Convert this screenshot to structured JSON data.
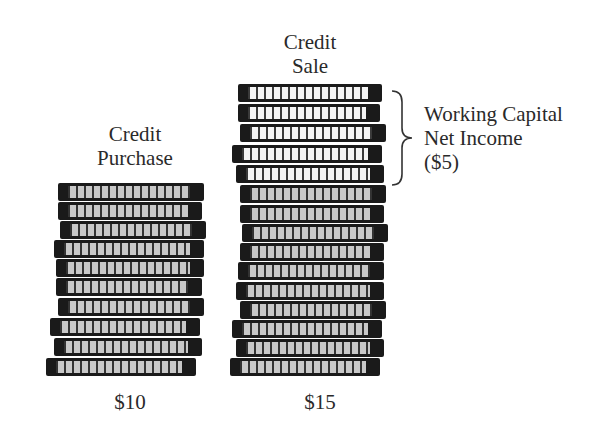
{
  "left_stack": {
    "label_line1": "Credit",
    "label_line2": "Purchase",
    "value": "$10",
    "coin_count": 10
  },
  "right_stack": {
    "label_line1": "Credit",
    "label_line2": "Sale",
    "value": "$15",
    "coin_count": 15,
    "highlighted_coins": 5
  },
  "annotation": {
    "line1": "Working Capital",
    "line2": "Net Income",
    "line3": "($5)"
  },
  "colors": {
    "coin_edge": "#1a1a1a",
    "coin_face": "#c8c8c8",
    "coin_face_highlight": "#f4f4f4",
    "text": "#2a2a2a"
  }
}
